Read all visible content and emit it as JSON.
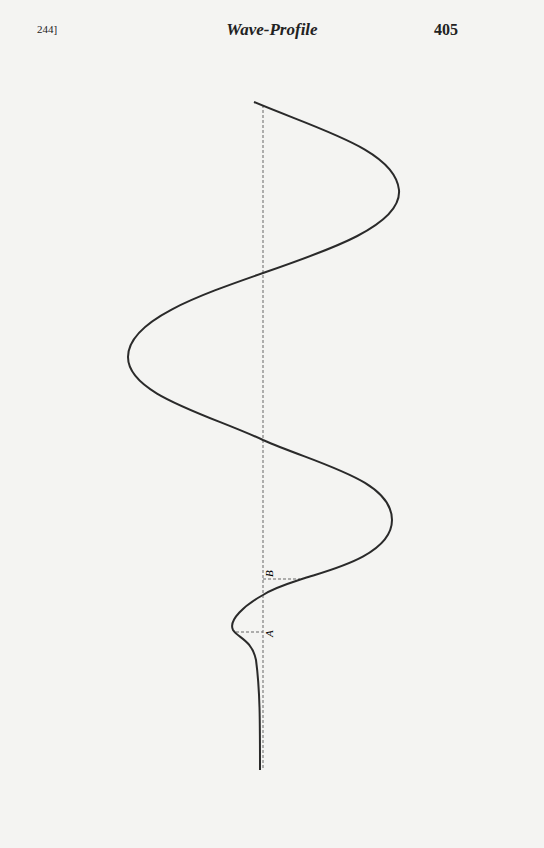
{
  "header": {
    "section_ref": "244]",
    "title": "Wave-Profile",
    "page_number": "405"
  },
  "figure": {
    "labels": {
      "b": "B",
      "a": "A"
    },
    "axis": {
      "x": 263,
      "y_top": 105,
      "y_bottom": 770
    },
    "curve_color": "#2a2a2a",
    "axis_color": "#666666"
  }
}
